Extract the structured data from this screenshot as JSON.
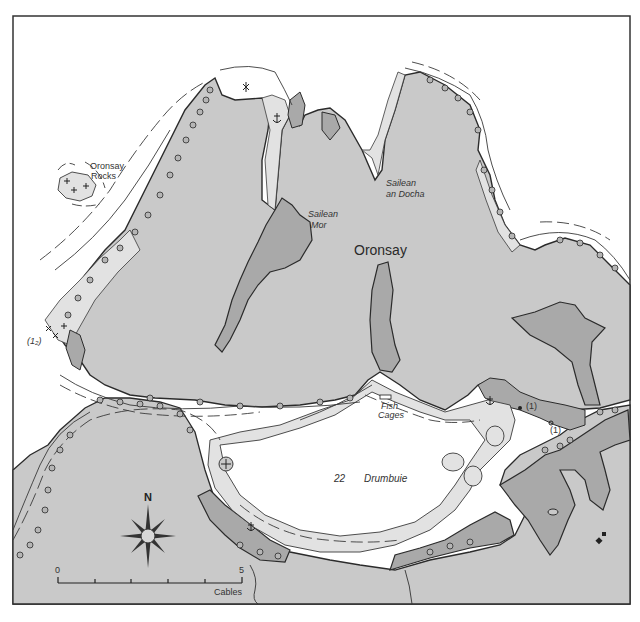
{
  "map": {
    "title_place": "Oronsay",
    "colors": {
      "background": "#ffffff",
      "land": "#c9c9c9",
      "drying": "#a9a9a9",
      "shallows": "#e2e2e2",
      "water": "#ffffff",
      "coastline": "#2b2b2b",
      "contour": "#3a3a3a",
      "frame": "#333333"
    },
    "labels": {
      "oronsay": "Oronsay",
      "oronsay_rocks_1": "Oronsay",
      "oronsay_rocks_2": "Rocks",
      "sailean_mor_1": "Sailean",
      "sailean_mor_2": "Mor",
      "sailean_an_docha_1": "Sailean",
      "sailean_an_docha_2": "an Docha",
      "fish_cages_1": "Fish",
      "fish_cages_2": "Cages",
      "drumbuie": "Drumbuie",
      "depth_22": "22",
      "drying_height_left": "(1₂)",
      "drying_height_1a": "(1)",
      "drying_height_1b": "(1)"
    },
    "compass": {
      "north_label": "N"
    },
    "scale_bar": {
      "start_label": "0",
      "end_label": "5",
      "unit_label": "Cables",
      "ticks": 6
    },
    "symbols": {
      "anchorages": [
        "anchor-north-inlet",
        "anchor-drumbuie-sw",
        "anchor-east-bay"
      ],
      "rock_marks": [
        "oronsay-rocks",
        "west-point-rocks",
        "buoy-plus-drumbuie"
      ]
    }
  }
}
